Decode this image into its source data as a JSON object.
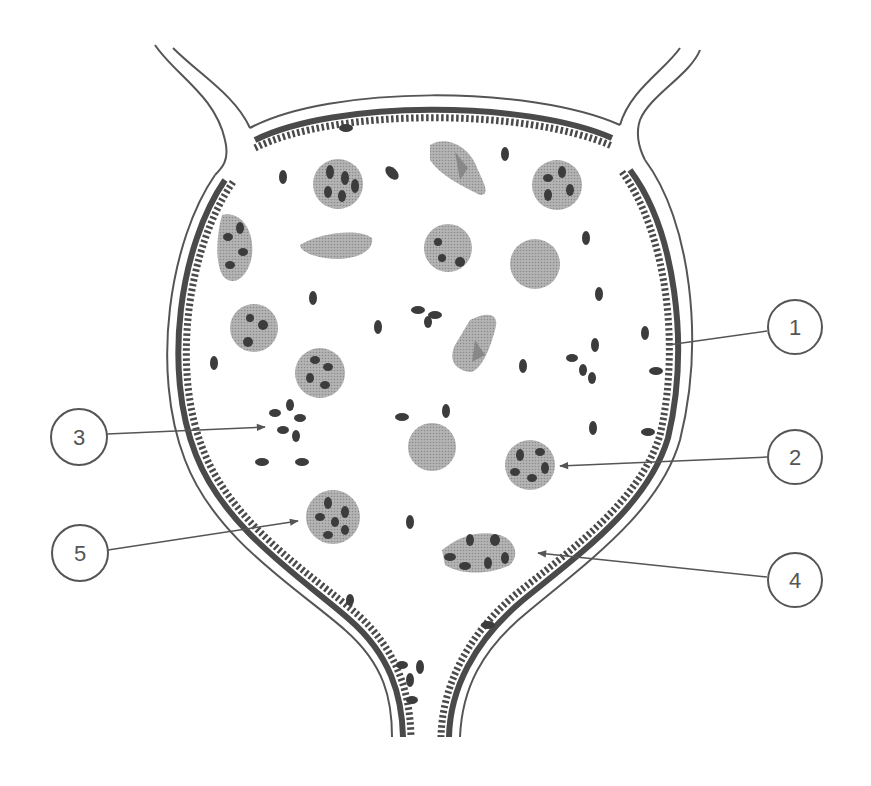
{
  "diagram": {
    "colors": {
      "line": "#555555",
      "epithelium": "#4a4a4a",
      "cell_body": "#a8a8a8",
      "nucleus": "#3c3c3c",
      "rbc": "#9a9a9a",
      "background": "#ffffff"
    }
  },
  "callouts": [
    {
      "label": "1",
      "cx": 795,
      "cy": 327,
      "tx": 668,
      "ty": 345
    },
    {
      "label": "2",
      "cx": 795,
      "cy": 457,
      "tx": 560,
      "ty": 466
    },
    {
      "label": "3",
      "cx": 79,
      "cy": 437,
      "tx": 265,
      "ty": 427
    },
    {
      "label": "4",
      "cx": 795,
      "cy": 580,
      "tx": 538,
      "ty": 553
    },
    {
      "label": "5",
      "cx": 80,
      "cy": 553,
      "tx": 298,
      "ty": 521
    }
  ]
}
